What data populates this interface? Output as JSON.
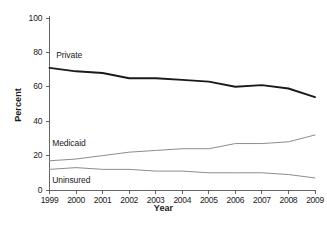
{
  "chart_data": {
    "type": "line",
    "title": "",
    "xlabel": "Year",
    "ylabel": "Percent",
    "x": [
      1999,
      2000,
      2001,
      2002,
      2003,
      2004,
      2005,
      2006,
      2007,
      2008,
      2009
    ],
    "xtick_labels": [
      "1999",
      "2000",
      "2001",
      "2002",
      "2003",
      "2004",
      "2005",
      "2006",
      "2007",
      "2008",
      "2009"
    ],
    "ytick_labels": [
      "0",
      "20",
      "40",
      "60",
      "80",
      "100"
    ],
    "yticks": [
      0,
      20,
      40,
      60,
      80,
      100
    ],
    "ylim": [
      0,
      100
    ],
    "xlim": [
      1999,
      2009
    ],
    "grid": false,
    "legend": "inline-labels",
    "series": [
      {
        "name": "Private",
        "color": "#1a1a1a",
        "width": 1.9,
        "label_x": 1999.25,
        "label_y": 78,
        "values": [
          71,
          69,
          68,
          65,
          65,
          64,
          63,
          60,
          61,
          59,
          54
        ]
      },
      {
        "name": "Medicaid",
        "color": "#8c8c8c",
        "width": 1.0,
        "label_x": 1999.1,
        "label_y": 27,
        "values": [
          17,
          18,
          20,
          22,
          23,
          24,
          24,
          27,
          27,
          28,
          32
        ]
      },
      {
        "name": "Uninsured",
        "color": "#8c8c8c",
        "width": 1.0,
        "label_x": 1999.1,
        "label_y": 5,
        "values": [
          12,
          13,
          12,
          12,
          11,
          11,
          10,
          10,
          10,
          9,
          7
        ]
      }
    ]
  },
  "axis": {
    "percent_label": "Percent",
    "year_label": "Year"
  }
}
